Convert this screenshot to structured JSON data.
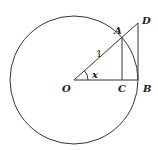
{
  "diagram": {
    "type": "unit-circle-trig",
    "circle": {
      "cx": 74,
      "cy": 80,
      "r": 64
    },
    "points": {
      "O": {
        "label": "O",
        "x": 74,
        "y": 80
      },
      "A": {
        "label": "A",
        "x": 122,
        "y": 37
      },
      "B": {
        "label": "B",
        "x": 138,
        "y": 80
      },
      "C": {
        "label": "C",
        "x": 122,
        "y": 80
      },
      "D": {
        "label": "D",
        "x": 138,
        "y": 23
      }
    },
    "radius_label": "1",
    "angle_label": "x",
    "colors": {
      "stroke": "#333333",
      "text": "#222222"
    }
  }
}
